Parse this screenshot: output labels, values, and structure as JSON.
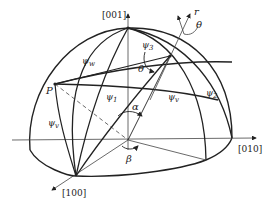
{
  "diagram": {
    "axes": {
      "z": "[001]",
      "y": "[010]",
      "x": "[100]"
    },
    "vector": {
      "label": "r",
      "angle_label": "θ"
    },
    "point": {
      "label": "P"
    },
    "angles": {
      "alpha": "α",
      "beta": "β",
      "theta": "θ"
    },
    "psi_labels": {
      "psi1": "ψ",
      "psi1_sub": "1",
      "psi2": "ψ",
      "psi2_sub": "2",
      "psi3": "ψ",
      "psi3_sub": "3",
      "psi_w": "ψ",
      "psi_w_sub": "w",
      "psi_v": "ψ",
      "psi_v_sub": "v",
      "psi_v2": "ψ",
      "psi_v2_sub": "v"
    },
    "colors": {
      "line": "#222222",
      "background": "#ffffff"
    }
  }
}
